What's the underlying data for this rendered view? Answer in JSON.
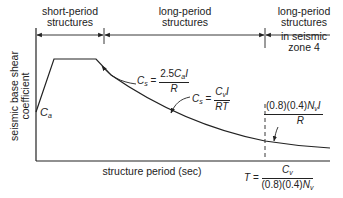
{
  "diagram": {
    "regions": [
      {
        "label_line1": "short-period",
        "label_line2": "structures"
      },
      {
        "label_line1": "long-period",
        "label_line2": "structures"
      },
      {
        "label_line1": "long-period",
        "label_line2": "structures",
        "label_line3": "in seismic",
        "label_line4": "zone 4"
      }
    ],
    "axes": {
      "y_label_line1": "seismic base shear",
      "y_label_line2": "coefficient",
      "x_label": "structure period (sec)"
    },
    "annotations": {
      "ca": {
        "symbol": "C",
        "sub": "a"
      },
      "cs_plateau": {
        "lhs_symbol": "C",
        "lhs_sub": "s",
        "eq": "=",
        "num_prefix": "2.5",
        "num_symbol": "C",
        "num_sub": "a",
        "num_suffix": "I",
        "den": "R"
      },
      "cs_decay": {
        "lhs_symbol": "C",
        "lhs_sub": "s",
        "eq": "=",
        "num_symbol": "C",
        "num_sub": "v",
        "num_suffix": "I",
        "den": "RT"
      },
      "cs_min": {
        "num_prefix": "(0.8)(0.4)",
        "num_symbol": "N",
        "num_sub": "v",
        "num_suffix": "I",
        "den": "R"
      },
      "t_boundary": {
        "lhs": "T",
        "eq": "=",
        "num_symbol": "C",
        "num_sub": "v",
        "den_prefix": "(0.8)(0.4)",
        "den_symbol": "N",
        "den_sub": "v"
      }
    },
    "colors": {
      "line": "#222222",
      "background": "#ffffff"
    }
  }
}
